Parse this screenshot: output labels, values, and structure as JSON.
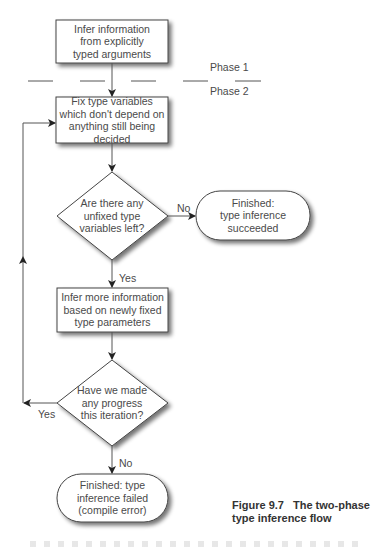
{
  "diagram": {
    "nodes": {
      "infer_explicit": {
        "lines": [
          "Infer information",
          "from explicitly",
          "typed arguments"
        ],
        "shape": "rectangle"
      },
      "fix_vars": {
        "lines": [
          "Fix type variables",
          "which don't depend on",
          "anything still being decided"
        ],
        "shape": "rectangle"
      },
      "unfixed_check": {
        "lines": [
          "Are there any",
          "unfixed type",
          "variables left?"
        ],
        "shape": "diamond"
      },
      "succeeded": {
        "lines": [
          "Finished:",
          "type inference",
          "succeeded"
        ],
        "shape": "rounded"
      },
      "infer_more": {
        "lines": [
          "Infer more information",
          "based on newly fixed",
          "type parameters"
        ],
        "shape": "rectangle"
      },
      "progress_check": {
        "lines": [
          "Have we made",
          "any progress",
          "this iteration?"
        ],
        "shape": "diamond"
      },
      "failed": {
        "lines": [
          "Finished: type",
          "inference failed",
          "(compile error)"
        ],
        "shape": "rounded"
      }
    },
    "edge_labels": {
      "unfixed_no": "No",
      "unfixed_yes": "Yes",
      "progress_yes": "Yes",
      "progress_no": "No"
    },
    "phases": {
      "phase1": "Phase 1",
      "phase2": "Phase 2"
    }
  },
  "caption": {
    "number": "Figure 9.7",
    "line1": "The two-phase",
    "line2": "type inference flow"
  }
}
